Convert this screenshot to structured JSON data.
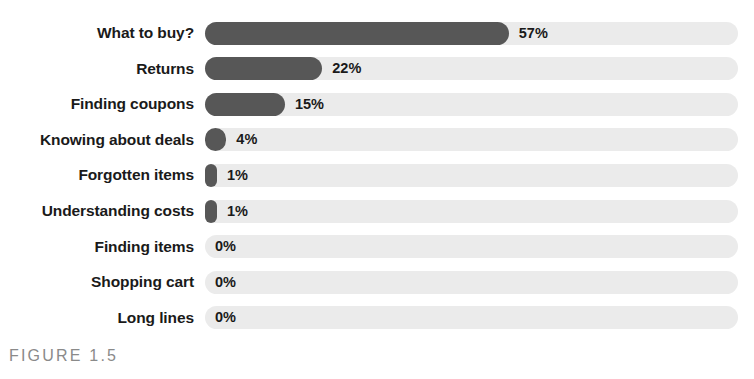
{
  "figure": {
    "caption": "FIGURE 1.5"
  },
  "colors": {
    "bar_fill": "#575757",
    "bar_track": "#ebebeb",
    "label_text": "#1a1a1a",
    "caption_text": "#8a8a8a",
    "background": "#ffffff"
  },
  "chart_data": {
    "type": "bar",
    "orientation": "horizontal",
    "title": "",
    "subtitle": "",
    "xlabel": "",
    "ylabel": "",
    "xlim": [
      0,
      100
    ],
    "grid": false,
    "legend": null,
    "value_suffix": "%",
    "categories": [
      "What to buy?",
      "Returns",
      "Finding coupons",
      "Knowing about deals",
      "Forgotten items",
      "Understanding costs",
      "Finding items",
      "Shopping cart",
      "Long lines"
    ],
    "values": [
      57,
      22,
      15,
      4,
      1,
      1,
      0,
      0,
      0
    ],
    "data_labels": [
      "57%",
      "22%",
      "15%",
      "4%",
      "1%",
      "1%",
      "0%",
      "0%",
      "0%"
    ],
    "rows": [
      {
        "label": "What to buy?",
        "value": 57,
        "display": "57%"
      },
      {
        "label": "Returns",
        "value": 22,
        "display": "22%"
      },
      {
        "label": "Finding coupons",
        "value": 15,
        "display": "15%"
      },
      {
        "label": "Knowing about deals",
        "value": 4,
        "display": "4%"
      },
      {
        "label": "Forgotten items",
        "value": 1,
        "display": "1%"
      },
      {
        "label": "Understanding costs",
        "value": 1,
        "display": "1%"
      },
      {
        "label": "Finding items",
        "value": 0,
        "display": "0%"
      },
      {
        "label": "Shopping cart",
        "value": 0,
        "display": "0%"
      },
      {
        "label": "Long lines",
        "value": 0,
        "display": "0%"
      }
    ]
  }
}
